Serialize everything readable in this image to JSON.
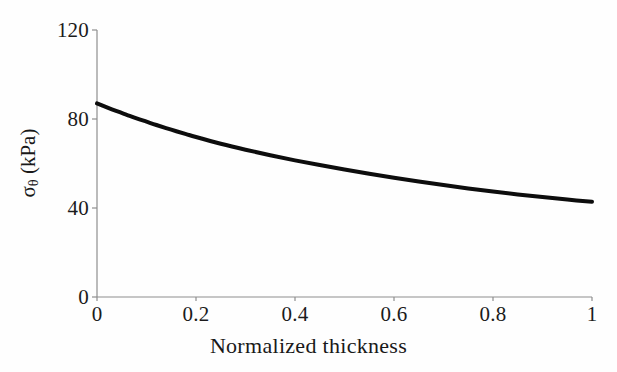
{
  "figure": {
    "background_color": "#fefefe",
    "axis_color": "#8e8e8e",
    "curve_color": "#0d0d0d"
  },
  "axes": {
    "y_title_symbol": "σ",
    "y_title_subscript": "θ",
    "y_title_units": " (kPa)",
    "x_title": "Normalized thickness",
    "y_tick_labels": [
      "0",
      "40",
      "80",
      "120"
    ],
    "x_tick_labels": [
      "0",
      "0.2",
      "0.4",
      "0.6",
      "0.8",
      "1"
    ]
  },
  "chart_data": {
    "type": "line",
    "title": "",
    "subtitle": "",
    "xlabel": "Normalized thickness",
    "ylabel": "σθ (kPa)",
    "xlim": [
      0,
      1
    ],
    "ylim": [
      0,
      120
    ],
    "xticks": [
      0,
      0.2,
      0.4,
      0.6,
      0.8,
      1
    ],
    "yticks": [
      0,
      40,
      80,
      120
    ],
    "grid": false,
    "legend": null,
    "annotations": [],
    "series": [
      {
        "name": "hoop stress",
        "color": "#0d0d0d",
        "linewidth": 4,
        "x": [
          0.0,
          0.02,
          0.04,
          0.06,
          0.08,
          0.1,
          0.12,
          0.15,
          0.18,
          0.2,
          0.25,
          0.3,
          0.35,
          0.4,
          0.45,
          0.5,
          0.55,
          0.6,
          0.65,
          0.7,
          0.75,
          0.8,
          0.85,
          0.9,
          0.95,
          1.0
        ],
        "values": [
          87.0,
          85.2,
          83.5,
          81.9,
          80.3,
          78.8,
          77.3,
          75.2,
          73.2,
          71.9,
          68.9,
          66.2,
          63.7,
          61.4,
          59.3,
          57.3,
          55.4,
          53.6,
          51.9,
          50.3,
          48.8,
          47.4,
          46.1,
          44.9,
          43.8,
          42.8
        ]
      }
    ]
  }
}
